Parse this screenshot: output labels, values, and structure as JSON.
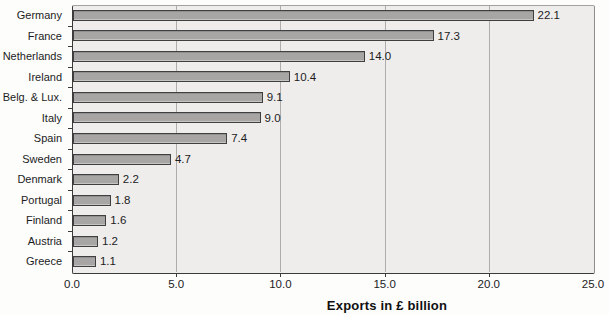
{
  "chart_data": {
    "type": "bar",
    "orientation": "horizontal",
    "title": "",
    "xlabel": "Exports in £ billion",
    "ylabel": "",
    "categories": [
      "Germany",
      "France",
      "Netherlands",
      "Ireland",
      "Belg. & Lux.",
      "Italy",
      "Spain",
      "Sweden",
      "Denmark",
      "Portugal",
      "Finland",
      "Austria",
      "Greece"
    ],
    "values": [
      22.1,
      17.3,
      14.0,
      10.4,
      9.1,
      9.0,
      7.4,
      4.7,
      2.2,
      1.8,
      1.6,
      1.2,
      1.1
    ],
    "value_labels": [
      "22.1",
      "17.3",
      "14.0",
      "10.4",
      "9.1",
      "9.0",
      "7.4",
      "4.7",
      "2.2",
      "1.8",
      "1.6",
      "1.2",
      "1.1"
    ],
    "xlim": [
      0,
      25
    ],
    "xticks": [
      "0.0",
      "5.0",
      "10.0",
      "15.0",
      "20.0",
      "25.0"
    ],
    "grid": "vertical-gridlines-on",
    "legend": "none",
    "colors": {
      "bar_fill": "#a7a6a5",
      "bar_border": "#3f3f3f",
      "plot_background": "#eeedec",
      "gridline": "#aeadab",
      "axis_line": "#3b3b3b",
      "text": "#1c1c1c",
      "page_background": "#fdfdfc"
    }
  }
}
